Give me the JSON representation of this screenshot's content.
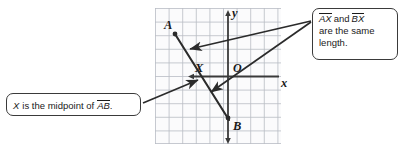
{
  "figure": {
    "type": "coordinate-plane-diagram",
    "axes": {
      "x_label": "x",
      "y_label": "y",
      "origin_label": "O",
      "grid": true,
      "grid_columns": 9,
      "grid_rows": 10
    },
    "points": [
      {
        "label": "A",
        "x": -4,
        "y": 3
      },
      {
        "label": "X",
        "x": -2,
        "y": 0
      },
      {
        "label": "B",
        "x": 0,
        "y": -3
      },
      {
        "label": "O",
        "x": 0,
        "y": 0
      }
    ],
    "segments": [
      {
        "name": "AB",
        "from": "A",
        "to": "B"
      }
    ]
  },
  "callouts": {
    "right": {
      "name": "equal-length-callout",
      "segment_1": "AX",
      "conjunction": "and",
      "segment_2": "BX",
      "line_2": "are the same",
      "line_3": "length."
    },
    "left": {
      "name": "midpoint-callout",
      "subject": "X",
      "text_before": "is the midpoint of",
      "segment": "AB",
      "period": "."
    }
  },
  "colors": {
    "grid_line": "#b9bcc4",
    "grid_fill": "#fbfbfc",
    "axis": "#3a3a3a",
    "segment": "#2b2b2b",
    "callout_border": "#3a3a3a",
    "text": "#1a1a1a"
  }
}
